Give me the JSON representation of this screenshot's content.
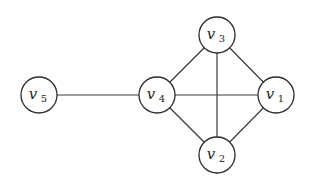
{
  "graph": {
    "radius": 18,
    "nodes": [
      {
        "id": "v1",
        "base": "v",
        "sub": "1",
        "x": 276,
        "y": 95
      },
      {
        "id": "v2",
        "base": "v",
        "sub": "2",
        "x": 217,
        "y": 155
      },
      {
        "id": "v3",
        "base": "v",
        "sub": "3",
        "x": 217,
        "y": 35
      },
      {
        "id": "v4",
        "base": "v",
        "sub": "4",
        "x": 157,
        "y": 95
      },
      {
        "id": "v5",
        "base": "v",
        "sub": "5",
        "x": 39,
        "y": 95
      }
    ],
    "edges": [
      [
        "v5",
        "v4"
      ],
      [
        "v4",
        "v3"
      ],
      [
        "v4",
        "v2"
      ],
      [
        "v4",
        "v1"
      ],
      [
        "v3",
        "v1"
      ],
      [
        "v3",
        "v2"
      ],
      [
        "v2",
        "v1"
      ]
    ],
    "colors": {
      "stroke": "#2e2e2e",
      "fill": "#ffffff",
      "text": "#1e1e1e"
    }
  }
}
